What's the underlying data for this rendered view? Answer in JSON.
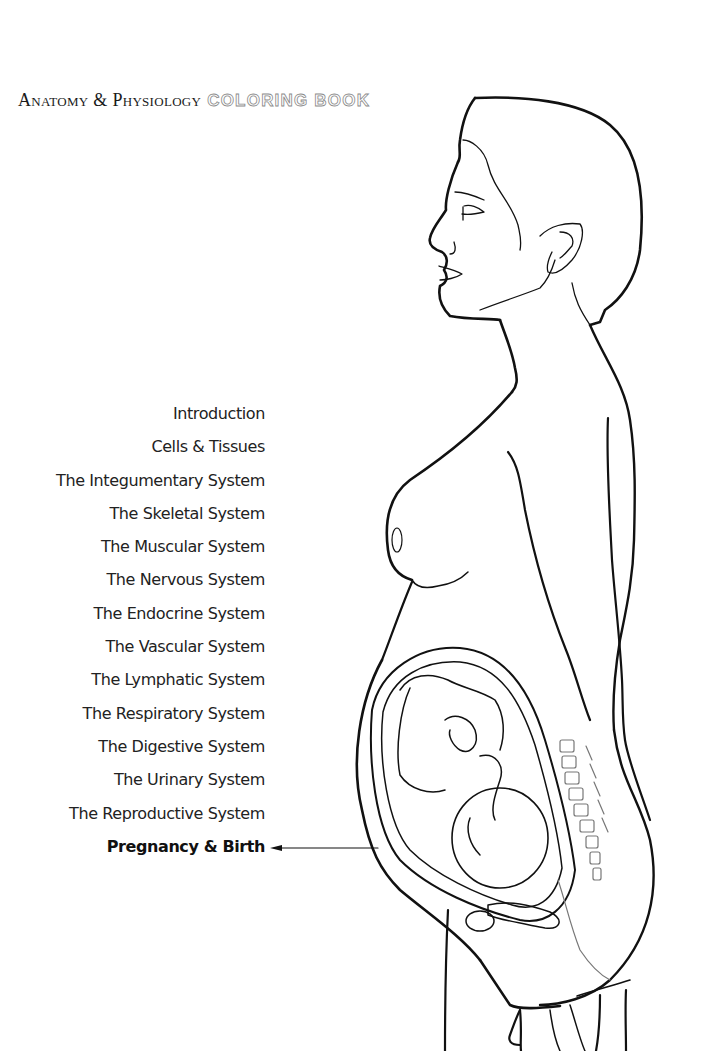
{
  "header": {
    "title_serif": "Anatomy & Physiology",
    "title_outline": "COLORING BOOK"
  },
  "toc": {
    "items": [
      {
        "label": "Introduction",
        "current": false
      },
      {
        "label": "Cells & Tissues",
        "current": false
      },
      {
        "label": "The Integumentary System",
        "current": false
      },
      {
        "label": "The Skeletal System",
        "current": false
      },
      {
        "label": "The Muscular System",
        "current": false
      },
      {
        "label": "The Nervous System",
        "current": false
      },
      {
        "label": "The Endocrine System",
        "current": false
      },
      {
        "label": "The Vascular System",
        "current": false
      },
      {
        "label": "The Lymphatic System",
        "current": false
      },
      {
        "label": "The Respiratory System",
        "current": false
      },
      {
        "label": "The Digestive System",
        "current": false
      },
      {
        "label": "The Urinary System",
        "current": false
      },
      {
        "label": "The Reproductive System",
        "current": false
      },
      {
        "label": "Pregnancy & Birth",
        "current": true
      }
    ]
  },
  "illustration": {
    "subject": "pregnant-woman-profile-with-fetus-in-uterus",
    "pointer": "arrow-left-icon"
  },
  "colors": {
    "background": "#ffffff",
    "text": "#222222",
    "line_art": "#111111",
    "outline_title": "#8a8a8a"
  }
}
